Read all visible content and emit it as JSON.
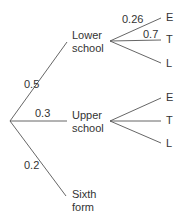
{
  "tree": {
    "level1": [
      {
        "name": "Lower school",
        "line1": "Lower",
        "line2": "school",
        "prob": "0.5"
      },
      {
        "name": "Upper school",
        "line1": "Upper",
        "line2": "school",
        "prob": "0.3"
      },
      {
        "name": "Sixth form",
        "line1": "Sixth",
        "line2": "form",
        "prob": "0.2"
      }
    ],
    "lower_branches": [
      {
        "label": "E",
        "prob": "0.26"
      },
      {
        "label": "T",
        "prob": "0.7"
      },
      {
        "label": "L",
        "prob": ""
      }
    ],
    "upper_branches": [
      {
        "label": "E"
      },
      {
        "label": "T"
      },
      {
        "label": "L"
      }
    ]
  }
}
